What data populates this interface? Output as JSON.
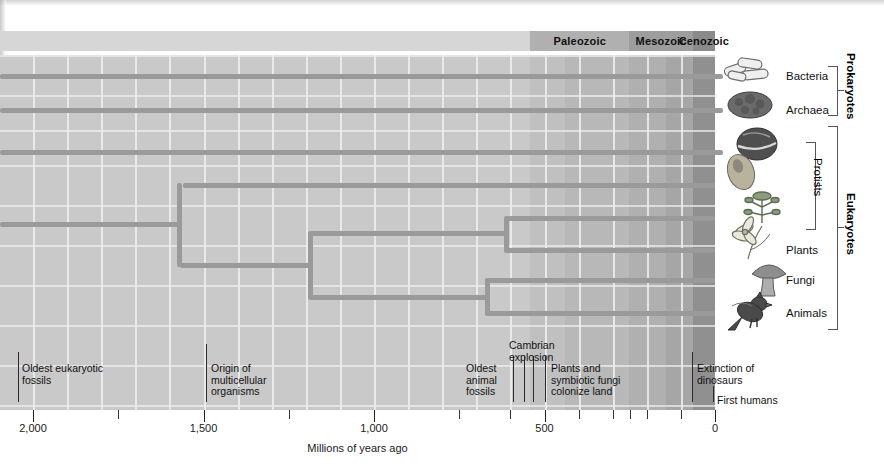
{
  "figure": {
    "axis_title": "Millions of years ago",
    "axis_ticks": [
      {
        "value": 2000,
        "label": "2,000"
      },
      {
        "value": 1500,
        "label": "1,500"
      },
      {
        "value": 1000,
        "label": "1,000"
      },
      {
        "value": 500,
        "label": "500"
      },
      {
        "value": 0,
        "label": "0"
      }
    ],
    "axis_minor_ticks": [
      1750,
      1250,
      750,
      250,
      400,
      300,
      200,
      100,
      600
    ],
    "axis_range": [
      2120,
      0
    ],
    "colors": {
      "branch": "#9a9a9a",
      "field": "#c9c9c9",
      "era_bar": "#d6d6d6",
      "text": "#111111"
    }
  },
  "eras": [
    {
      "name": "Paleozoic",
      "start": 542,
      "end": 251,
      "shade": "#b0b0b0"
    },
    {
      "name": "Mesozoic",
      "start": 251,
      "end": 65,
      "shade": "#9d9d9d"
    },
    {
      "name": "Cenozoic",
      "start": 65,
      "end": 0,
      "shade": "#8a8a8a"
    }
  ],
  "background_bands": [
    {
      "start": 2120,
      "end": 542,
      "shade": "#c9c9c9"
    },
    {
      "start": 542,
      "end": 440,
      "shade": "#c0c0c0"
    },
    {
      "start": 440,
      "end": 251,
      "shade": "#b8b8b8"
    },
    {
      "start": 251,
      "end": 145,
      "shade": "#b0b0b0"
    },
    {
      "start": 145,
      "end": 65,
      "shade": "#a6a6a6"
    },
    {
      "start": 65,
      "end": 0,
      "shade": "#909090"
    }
  ],
  "taxa": [
    {
      "name": "Bacteria",
      "label": "Bacteria",
      "y": 76,
      "origin": 2120,
      "icon": "rod-bacteria-illustration"
    },
    {
      "name": "Archaea",
      "label": "Archaea",
      "y": 110,
      "origin": 2120,
      "icon": "archaea-cell-illustration"
    },
    {
      "name": "Protist1",
      "label": "",
      "y": 152,
      "origin": 2120,
      "icon": "dinoflagellate-illustration"
    },
    {
      "name": "Protist2",
      "label": "",
      "y": 185,
      "origin": 1560,
      "icon": "amoeboid-protist-illustration"
    },
    {
      "name": "Protist3",
      "label": "",
      "y": 218,
      "origin": 610,
      "icon": "green-algae-illustration"
    },
    {
      "name": "Plants",
      "label": "Plants",
      "y": 250,
      "origin": 610,
      "icon": "flowering-plant-illustration"
    },
    {
      "name": "Fungi",
      "label": "Fungi",
      "y": 280,
      "origin": 665,
      "icon": "mushroom-illustration"
    },
    {
      "name": "Animals",
      "label": "Animals",
      "y": 313,
      "origin": 665,
      "icon": "bird-illustration"
    }
  ],
  "nodes": [
    {
      "name": "eukaryote-root",
      "x": 1570,
      "top": 185,
      "bottom": 264,
      "stem_y": 224
    },
    {
      "name": "crown-eukaryotes",
      "x": 1185,
      "top": 233,
      "bottom": 297,
      "stem_y": 265
    },
    {
      "name": "plants-protist-split",
      "x": 612,
      "top": 218,
      "bottom": 250,
      "stem_y": 233
    },
    {
      "name": "fungi-animal-split",
      "x": 667,
      "top": 280,
      "bottom": 313,
      "stem_y": 297
    }
  ],
  "annotations": [
    {
      "name": "oldest-eukaryotic-fossils",
      "text": "Oldest eukaryotic\nfossils",
      "x_px": 22,
      "y_px": 363,
      "leader_x": 18,
      "leader_top": 352,
      "leader_h": 50
    },
    {
      "name": "origin-of-multicellular-organisms",
      "text": "Origin of\nmulticellular\norganisms",
      "x_px": 211,
      "y_px": 363,
      "leader_x": 206,
      "leader_top": 344,
      "leader_h": 58
    },
    {
      "name": "oldest-animal-fossils",
      "text": "Oldest\nanimal\nfossils",
      "x_px": 466,
      "y_px": 363,
      "leader_x": 513,
      "leader_top": 356,
      "leader_h": 46
    },
    {
      "name": "cambrian-explosion",
      "text": "Cambrian\nexplosion",
      "x_px": 509,
      "y_px": 340,
      "leader_x": 533,
      "leader_top": 356,
      "leader_h": 46
    },
    {
      "name": "plants-and-symbiotic-fungi-colonize-land",
      "text": "Plants and\nsymbiotic fungi\ncolonize land",
      "x_px": 551,
      "y_px": 363,
      "leader_x": 545,
      "leader_top": 356,
      "leader_h": 46
    },
    {
      "name": "extinction-of-dinosaurs",
      "text": "Extinction of\ndinosaurs",
      "x_px": 697,
      "y_px": 363,
      "leader_x": 692,
      "leader_top": 352,
      "leader_h": 50
    },
    {
      "name": "first-humans",
      "text": "First humans",
      "x_px": 717,
      "y_px": 395,
      "leader_x": 713,
      "leader_top": 386,
      "leader_h": 16
    }
  ],
  "groups": [
    {
      "name": "Prokaryotes",
      "label": "Prokaryotes",
      "top": 66,
      "bottom": 114,
      "x": 828,
      "label_x": 845
    },
    {
      "name": "Protists",
      "label": "Protists",
      "top": 142,
      "bottom": 228,
      "x": 806,
      "label_x": 812
    },
    {
      "name": "Eukaryotes",
      "label": "Eukaryotes",
      "top": 126,
      "bottom": 328,
      "x": 828,
      "label_x": 845
    }
  ]
}
